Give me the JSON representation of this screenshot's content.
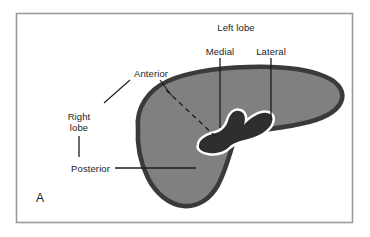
{
  "figure": {
    "panel_letter": "A",
    "frame": {
      "border_color": "#9a9a9a",
      "background": "#ffffff"
    },
    "organ": {
      "name": "liver",
      "fill_color": "#808080",
      "outline_color": "#3a3a3a",
      "hilum_color": "#2e2e2e",
      "hilum_highlight_color": "#ffffff"
    },
    "labels": [
      {
        "id": "left-lobe",
        "text": "Left lobe",
        "lines": [
          "Left lobe"
        ]
      },
      {
        "id": "medial",
        "text": "Medial",
        "lines": [
          "Medial"
        ]
      },
      {
        "id": "lateral",
        "text": "Lateral",
        "lines": [
          "Lateral"
        ]
      },
      {
        "id": "anterior",
        "text": "Anterior",
        "lines": [
          "Anterior"
        ]
      },
      {
        "id": "right-lobe",
        "text": "Right lobe",
        "lines": [
          "Right",
          "lobe"
        ]
      },
      {
        "id": "posterior",
        "text": "Posterior",
        "lines": [
          "Posterior"
        ]
      }
    ],
    "label_text": {
      "left_lobe": "Left lobe",
      "medial": "Medial",
      "lateral": "Lateral",
      "anterior": "Anterior",
      "right_lobe_line1": "Right",
      "right_lobe_line2": "lobe",
      "posterior": "Posterior",
      "panel_a": "A"
    },
    "leader_lines": {
      "medial": {
        "type": "vertical",
        "color": "#1c1c1c"
      },
      "lateral": {
        "type": "vertical",
        "color": "#1c1c1c"
      },
      "anterior_left": {
        "type": "diagonal",
        "color": "#1c1c1c"
      },
      "anterior_right": {
        "type": "diagonal",
        "color": "#1c1c1c"
      },
      "anterior_dashed": {
        "type": "dashed-diagonal",
        "color": "#1c1c1c"
      },
      "right_lobe": {
        "type": "vertical",
        "color": "#1c1c1c"
      },
      "posterior": {
        "type": "horizontal",
        "color": "#1c1c1c"
      }
    }
  }
}
